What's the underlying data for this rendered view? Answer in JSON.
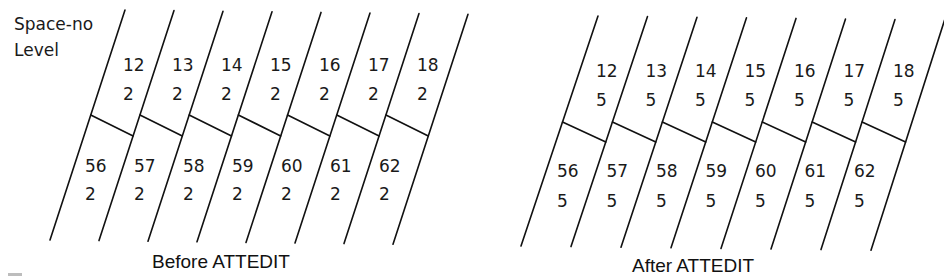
{
  "axis_labels": {
    "row1": "Space-no",
    "row2": "Level"
  },
  "diagrams": [
    {
      "caption": "Before ATTEDIT",
      "upper_cells": [
        {
          "space_no": "12",
          "level": "2"
        },
        {
          "space_no": "13",
          "level": "2"
        },
        {
          "space_no": "14",
          "level": "2"
        },
        {
          "space_no": "15",
          "level": "2"
        },
        {
          "space_no": "16",
          "level": "2"
        },
        {
          "space_no": "17",
          "level": "2"
        },
        {
          "space_no": "18",
          "level": "2"
        }
      ],
      "lower_cells": [
        {
          "space_no": "56",
          "level": "2"
        },
        {
          "space_no": "57",
          "level": "2"
        },
        {
          "space_no": "58",
          "level": "2"
        },
        {
          "space_no": "59",
          "level": "2"
        },
        {
          "space_no": "60",
          "level": "2"
        },
        {
          "space_no": "61",
          "level": "2"
        },
        {
          "space_no": "62",
          "level": "2"
        }
      ]
    },
    {
      "caption": "After ATTEDIT",
      "upper_cells": [
        {
          "space_no": "12",
          "level": "5"
        },
        {
          "space_no": "13",
          "level": "5"
        },
        {
          "space_no": "14",
          "level": "5"
        },
        {
          "space_no": "15",
          "level": "5"
        },
        {
          "space_no": "16",
          "level": "5"
        },
        {
          "space_no": "17",
          "level": "5"
        },
        {
          "space_no": "18",
          "level": "5"
        }
      ],
      "lower_cells": [
        {
          "space_no": "56",
          "level": "5"
        },
        {
          "space_no": "57",
          "level": "5"
        },
        {
          "space_no": "58",
          "level": "5"
        },
        {
          "space_no": "59",
          "level": "5"
        },
        {
          "space_no": "60",
          "level": "5"
        },
        {
          "space_no": "61",
          "level": "5"
        },
        {
          "space_no": "62",
          "level": "5"
        }
      ]
    }
  ]
}
